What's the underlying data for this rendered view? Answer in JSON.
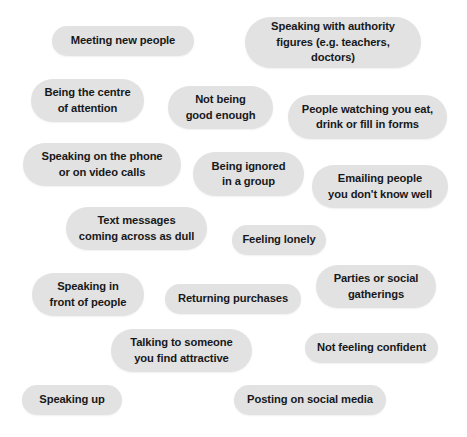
{
  "page": {
    "background_color": "#ffffff",
    "pill_color": "#e2e2e2",
    "text_color": "#17181a"
  },
  "pills": [
    {
      "id": "meeting-new-people",
      "text": "Meeting new people",
      "x": 52,
      "y": 26,
      "w": 142,
      "h": 30
    },
    {
      "id": "speaking-with-authority",
      "text": "Speaking with authority\nfigures (e.g. teachers, doctors)",
      "x": 245,
      "y": 17,
      "w": 176,
      "h": 51
    },
    {
      "id": "being-the-centre",
      "text": "Being the centre\nof attention",
      "x": 31,
      "y": 79,
      "w": 113,
      "h": 43
    },
    {
      "id": "not-being-good-enough",
      "text": "Not being\ngood enough",
      "x": 168,
      "y": 86,
      "w": 105,
      "h": 43
    },
    {
      "id": "people-watching-you-eat",
      "text": "People watching you eat,\ndrink or fill in forms",
      "x": 288,
      "y": 95,
      "w": 159,
      "h": 44
    },
    {
      "id": "speaking-on-the-phone",
      "text": "Speaking on the phone\nor on video calls",
      "x": 23,
      "y": 143,
      "w": 158,
      "h": 43
    },
    {
      "id": "being-ignored-in-a-group",
      "text": "Being ignored\nin a group",
      "x": 193,
      "y": 152,
      "w": 111,
      "h": 44
    },
    {
      "id": "emailing-people",
      "text": "Emailing people\nyou don't know well",
      "x": 312,
      "y": 165,
      "w": 136,
      "h": 43
    },
    {
      "id": "text-messages-dull",
      "text": "Text messages\ncoming across as dull",
      "x": 66,
      "y": 207,
      "w": 141,
      "h": 43
    },
    {
      "id": "feeling-lonely",
      "text": "Feeling lonely",
      "x": 232,
      "y": 225,
      "w": 94,
      "h": 30
    },
    {
      "id": "speaking-in-front",
      "text": "Speaking in\nfront of people",
      "x": 32,
      "y": 273,
      "w": 112,
      "h": 43
    },
    {
      "id": "returning-purchases",
      "text": "Returning purchases",
      "x": 165,
      "y": 284,
      "w": 136,
      "h": 30
    },
    {
      "id": "parties-or-social",
      "text": "Parties or social\ngatherings",
      "x": 316,
      "y": 265,
      "w": 120,
      "h": 43
    },
    {
      "id": "talking-to-someone",
      "text": "Talking to someone\nyou find attractive",
      "x": 111,
      "y": 329,
      "w": 141,
      "h": 43
    },
    {
      "id": "not-feeling-confident",
      "text": "Not feeling confident",
      "x": 305,
      "y": 333,
      "w": 133,
      "h": 30
    },
    {
      "id": "speaking-up",
      "text": "Speaking up",
      "x": 22,
      "y": 385,
      "w": 100,
      "h": 30
    },
    {
      "id": "posting-on-social-media",
      "text": "Posting on social media",
      "x": 234,
      "y": 385,
      "w": 152,
      "h": 30
    }
  ]
}
